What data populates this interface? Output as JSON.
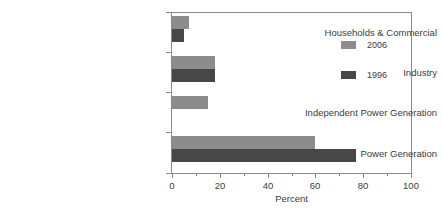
{
  "chart_data": {
    "type": "bar",
    "orientation": "horizontal",
    "title": "",
    "xlabel": "Percent",
    "ylabel": "",
    "xlim": [
      0,
      100
    ],
    "xticks": [
      0,
      20,
      40,
      60,
      80,
      100
    ],
    "xtick_labels": [
      "0",
      "20",
      "40",
      "60",
      "80",
      "100"
    ],
    "minor_xticks": [
      10,
      30,
      50,
      70,
      90
    ],
    "grid": false,
    "legend_position": "upper right inside",
    "categories": [
      "Households & Commercial",
      "Industry",
      "Independent Power Generation",
      "Power Generation"
    ],
    "series": [
      {
        "name": "2006",
        "color": "#8c8c8c",
        "values": [
          7,
          18,
          15,
          60
        ]
      },
      {
        "name": "1996",
        "color": "#474747",
        "values": [
          5,
          18,
          null,
          77
        ]
      }
    ]
  },
  "legend": {
    "entries": [
      {
        "label": "2006",
        "color": "#8c8c8c"
      },
      {
        "label": "1996",
        "color": "#474747"
      }
    ]
  },
  "axis": {
    "x_title": "Percent",
    "tick_labels": [
      "0",
      "20",
      "40",
      "60",
      "80",
      "100"
    ]
  },
  "categories": [
    {
      "label": "Households & Commercial"
    },
    {
      "label": "Industry"
    },
    {
      "label": "Independent Power Generation"
    },
    {
      "label": "Power Generation"
    }
  ],
  "colors": {
    "series_2006": "#8c8c8c",
    "series_1996": "#474747",
    "axis": "#8a8a8a",
    "text": "#3b3b3b",
    "background": "#ffffff"
  }
}
